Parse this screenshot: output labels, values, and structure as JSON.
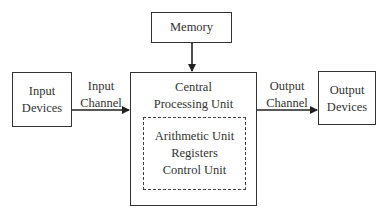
{
  "diagram": {
    "nodes": {
      "memory": {
        "label": "Memory"
      },
      "input_devices": {
        "line1": "Input",
        "line2": "Devices"
      },
      "cpu": {
        "line1": "Central",
        "line2": "Processing Unit"
      },
      "cpu_inner": {
        "line1": "Arithmetic Unit",
        "line2": "Registers",
        "line3": "Control Unit"
      },
      "output_devices": {
        "line1": "Output",
        "line2": "Devices"
      }
    },
    "edges": {
      "input_channel": {
        "line1": "Input",
        "line2": "Channel"
      },
      "output_channel": {
        "line1": "Output",
        "line2": "Channel"
      },
      "memory_cpu": {
        "direction": "bidirectional"
      }
    }
  }
}
